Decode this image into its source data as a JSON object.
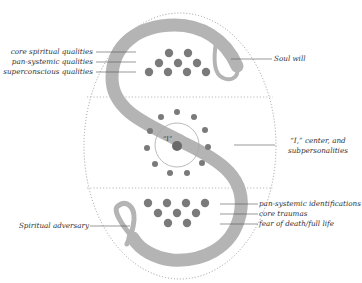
{
  "colors": {
    "s_band": "#b4b4b4",
    "dot": "#7a7a7a",
    "center_dot": "#6a6a6a",
    "dotted_oval": "#9a9a9a",
    "leader_line": "#555555",
    "text": "#333333"
  },
  "center_label": "“I”",
  "labels": {
    "core_spiritual_qualities": "core spiritual qualities",
    "pan_systemic_qualities": "pan-systemic qualities",
    "superconscious_qualities": "superconscious qualities",
    "soul_will": "Soul will",
    "i_center_line1": "“I,” center, and",
    "i_center_line2": "subpersonalities",
    "pan_systemic_identifications": "pan-systemic identifications",
    "core_traumas": "core traumas",
    "fear_of_death": "fear of death/full life",
    "spiritual_adversary": "Spiritual adversary"
  },
  "regions": [
    {
      "name": "upper",
      "dots": 9,
      "arrangement": "2-3-4 triangle"
    },
    {
      "name": "middle",
      "dots": 12,
      "arrangement": "ring around “I” circle"
    },
    {
      "name": "lower",
      "dots": 9,
      "arrangement": "4-3-2 inverted triangle"
    }
  ]
}
